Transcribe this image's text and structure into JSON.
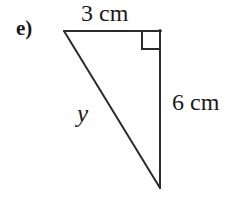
{
  "figure": {
    "item_label": "e)",
    "shape": "right-triangle",
    "background_color": "#ffffff",
    "stroke_color": "#2b2b2b",
    "text_color": "#1a1a1a",
    "labels": {
      "top_side": "3 cm",
      "right_side": "6 cm",
      "hypotenuse": "y"
    },
    "geometry": {
      "vertices": {
        "top_left": [
          64,
          31
        ],
        "top_right": [
          160,
          31
        ],
        "bottom_right": [
          160,
          188
        ]
      },
      "right_angle_marker": {
        "corner": "top_right",
        "size": 18
      }
    }
  }
}
